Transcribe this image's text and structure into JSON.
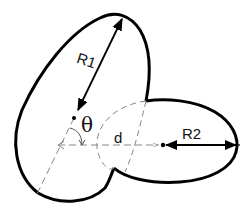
{
  "diagram": {
    "labels": {
      "r1": "R1",
      "r2": "R2",
      "theta": "θ",
      "d": "d"
    },
    "colors": {
      "outline": "#000000",
      "dashed": "#888888",
      "background": "#ffffff"
    }
  }
}
